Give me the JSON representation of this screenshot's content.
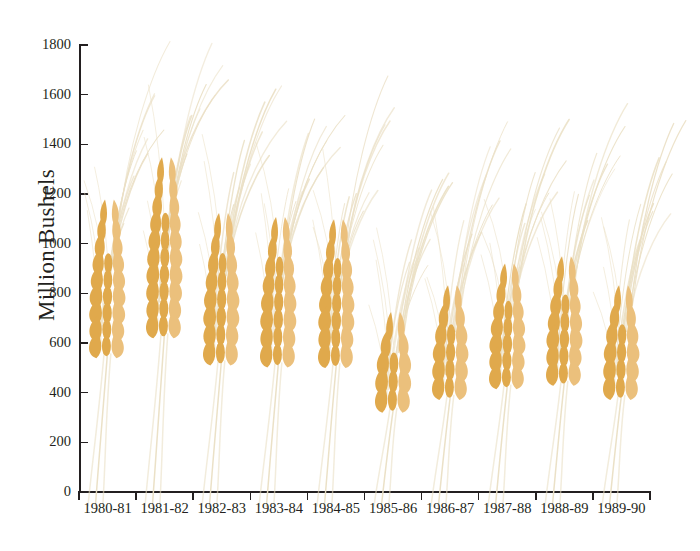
{
  "chart_data": {
    "type": "bar",
    "title": "",
    "xlabel": "",
    "ylabel": "Million Bushels",
    "categories": [
      "1980-81",
      "1981-82",
      "1982-83",
      "1983-84",
      "1984-85",
      "1985-86",
      "1986-87",
      "1987-88",
      "1988-89",
      "1989-90"
    ],
    "values": [
      1155,
      1325,
      1100,
      1085,
      1075,
      700,
      810,
      900,
      925,
      810
    ],
    "ylim": [
      0,
      1800
    ],
    "yticks": [
      0,
      200,
      400,
      600,
      800,
      1000,
      1200,
      1400,
      1600,
      1800
    ],
    "ytick_labels": [
      "0",
      "200",
      "400",
      "600",
      "800",
      "1000",
      "1200",
      "1400",
      "1600",
      "1800"
    ],
    "grid": false,
    "legend": null,
    "marker_style": "wheat-stalk-pictogram",
    "series": [
      {
        "name": "Million Bushels",
        "values": [
          1155,
          1325,
          1100,
          1085,
          1075,
          700,
          810,
          900,
          925,
          810
        ]
      }
    ],
    "colors": {
      "wheat_grain": "#E0A94C",
      "wheat_grain_light": "#EBC07C",
      "awn": "#EADFC4",
      "axis": "#231f20",
      "background": "#FFFFFF"
    }
  },
  "axis": {
    "y_label": "Million Bushels"
  }
}
